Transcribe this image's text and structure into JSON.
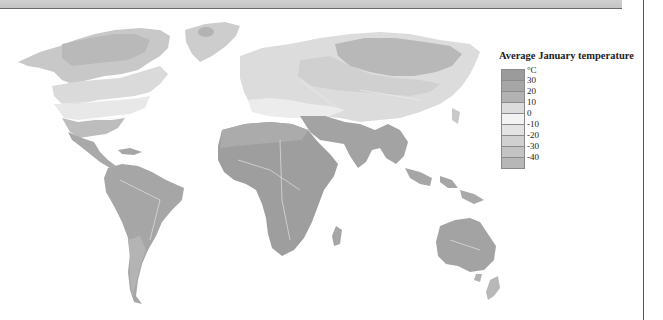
{
  "legend": {
    "title": "Average January temperature",
    "unit": "°C",
    "labels": [
      "30",
      "20",
      "10",
      "0",
      "-10",
      "-20",
      "-30",
      "-40"
    ],
    "swatches": [
      "#9b9b9b",
      "#a6a6a6",
      "#b2b2b2",
      "#dcdcdc",
      "#f3f3f3",
      "#e3e3e3",
      "#d0d0d0",
      "#c3c3c3",
      "#b7b7b7"
    ]
  },
  "map": {
    "subject": "World map of average January temperature",
    "colors": {
      "ocean": "#ffffff",
      "hot": "#9c9c9c",
      "warm": "#a9a9a9",
      "mild": "#bdbdbd",
      "cool": "#dadada",
      "cold": "#e6e6e6",
      "very_cold": "#cdcdcd",
      "extreme_cold": "#b9b9b9",
      "border": "#f4f4f4"
    }
  }
}
